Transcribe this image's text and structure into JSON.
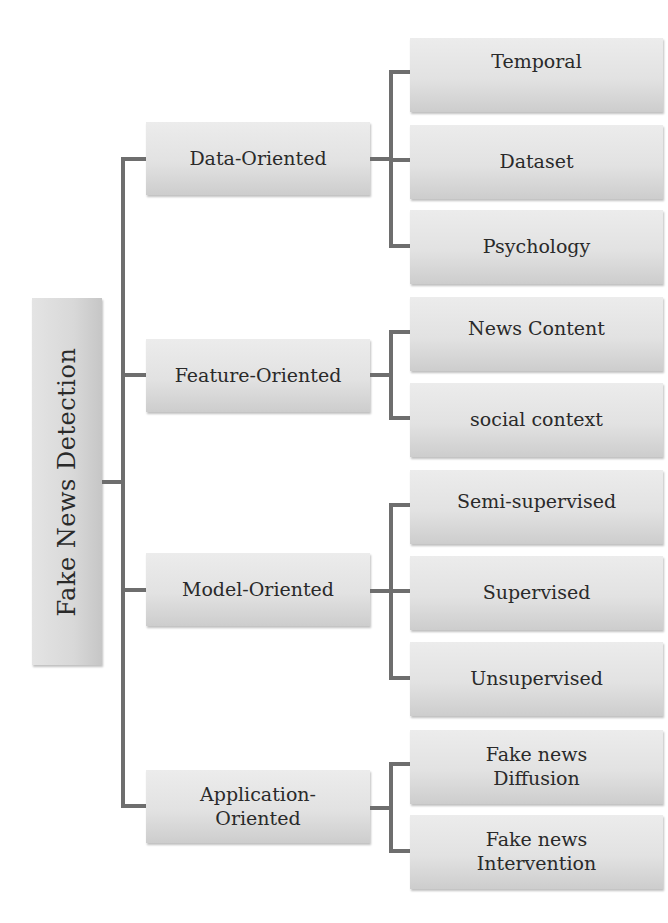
{
  "diagram": {
    "root": {
      "label": "Fake News Detection"
    },
    "branches": [
      {
        "label": "Data-Oriented",
        "children": [
          {
            "label": "Temporal"
          },
          {
            "label": "Dataset"
          },
          {
            "label": "Psychology"
          }
        ]
      },
      {
        "label": "Feature-Oriented",
        "children": [
          {
            "label": "News Content"
          },
          {
            "label": "social context"
          }
        ]
      },
      {
        "label": "Model-Oriented",
        "children": [
          {
            "label": "Semi-supervised"
          },
          {
            "label": "Supervised"
          },
          {
            "label": "Unsupervised"
          }
        ]
      },
      {
        "label": "Application-Oriented",
        "label_lines": [
          "Application-",
          "Oriented"
        ],
        "children": [
          {
            "label": "Fake news Diffusion",
            "label_lines": [
              "Fake news",
              "Diffusion"
            ]
          },
          {
            "label": "Fake news Intervention",
            "label_lines": [
              "Fake news",
              "Intervention"
            ]
          }
        ]
      }
    ],
    "colors": {
      "box_fill": "#e2e2e2",
      "connector": "#6e6e6e",
      "text": "#2a2a2a"
    }
  }
}
